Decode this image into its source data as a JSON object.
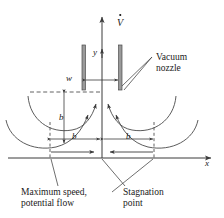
{
  "figure": {
    "background_color": "#ffffff",
    "line_color": "#3a3a3a",
    "text_color": "#1a1a1a",
    "nozzle_fill": "#9a9a9a"
  },
  "axes": {
    "x_label": "x",
    "y_label": "y"
  },
  "flow": {
    "flowrate_label": "V",
    "flowrate_dot": "˙"
  },
  "dimensions": {
    "width_label": "w",
    "b_vertical": "b",
    "b_left": "b",
    "b_right": "b"
  },
  "annotations": {
    "nozzle_line1": "Vacuum",
    "nozzle_line2": "nozzle",
    "max_speed_line1": "Maximum speed,",
    "max_speed_line2": "potential flow",
    "stagnation_line1": "Stagnation",
    "stagnation_line2": "point"
  }
}
